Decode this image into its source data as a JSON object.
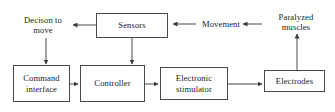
{
  "diagram": {
    "type": "block-flow-diagram",
    "background_color": "#ffffff",
    "stroke_color": "#4a4a4a",
    "text_color": "#1c1c1c",
    "nodes": [
      {
        "id": "decision_to_move",
        "label": "Decison to\nmove",
        "shape": "none",
        "boxed": false
      },
      {
        "id": "sensors",
        "label": "Sensors",
        "shape": "rectangle",
        "boxed": true
      },
      {
        "id": "movement",
        "label": "Movement",
        "shape": "none",
        "boxed": false
      },
      {
        "id": "paralyzed_muscles",
        "label": "Paralyzed\nmuscles",
        "shape": "none",
        "boxed": false
      },
      {
        "id": "command_interface",
        "label": "Command\ninterface",
        "shape": "rectangle",
        "boxed": true
      },
      {
        "id": "controller",
        "label": "Controller",
        "shape": "rectangle",
        "boxed": true
      },
      {
        "id": "electronic_stimulator",
        "label": "Electronic\nstimulator",
        "shape": "rectangle",
        "boxed": true
      },
      {
        "id": "electrodes",
        "label": "Electrodes",
        "shape": "rectangle",
        "boxed": true
      }
    ],
    "edges": [
      {
        "from": "paralyzed_muscles",
        "to": "movement",
        "direction": "leftward"
      },
      {
        "from": "movement",
        "to": "sensors",
        "direction": "leftward"
      },
      {
        "from": "sensors",
        "to": "decision_to_move",
        "direction": "leftward"
      },
      {
        "from": "sensors",
        "to": "controller",
        "direction": "downward"
      },
      {
        "from": "decision_to_move",
        "to": "command_interface",
        "direction": "downward"
      },
      {
        "from": "command_interface",
        "to": "controller",
        "direction": "rightward"
      },
      {
        "from": "controller",
        "to": "electronic_stimulator",
        "direction": "rightward"
      },
      {
        "from": "electronic_stimulator",
        "to": "electrodes",
        "direction": "rightward"
      },
      {
        "from": "electrodes",
        "to": "paralyzed_muscles",
        "direction": "upward"
      }
    ]
  }
}
